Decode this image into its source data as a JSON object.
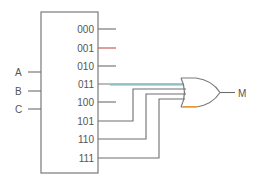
{
  "diagram": {
    "type": "decoder-or-logic-circuit",
    "inputs": [
      {
        "label": "A",
        "y": 72
      },
      {
        "label": "B",
        "y": 91
      },
      {
        "label": "C",
        "y": 109
      }
    ],
    "decoder_outputs": [
      {
        "label": "000",
        "y": 29,
        "connected": false,
        "color": "#6e6e6e"
      },
      {
        "label": "001",
        "y": 48,
        "connected": false,
        "color": "#c0504d"
      },
      {
        "label": "010",
        "y": 66,
        "connected": false,
        "color": "#6e6e6e"
      },
      {
        "label": "011",
        "y": 84,
        "connected": true,
        "color": "#5fc4c9"
      },
      {
        "label": "100",
        "y": 102,
        "connected": false,
        "color": "#6e6e6e"
      },
      {
        "label": "101",
        "y": 121,
        "connected": true,
        "color": "#6e6e6e"
      },
      {
        "label": "110",
        "y": 139,
        "connected": true,
        "color": "#6e6e6e"
      },
      {
        "label": "111",
        "y": 158,
        "connected": true,
        "color": "#6e6e6e"
      }
    ],
    "gate": {
      "type": "OR",
      "inputs": [
        "011",
        "101",
        "110",
        "111"
      ]
    },
    "output": {
      "label": "M"
    },
    "colors": {
      "wire": "#6e6e6e",
      "accent_teal": "#5fc4c9",
      "accent_red": "#c0504d",
      "accent_orange": "#e8953a",
      "text": "#555555"
    }
  }
}
